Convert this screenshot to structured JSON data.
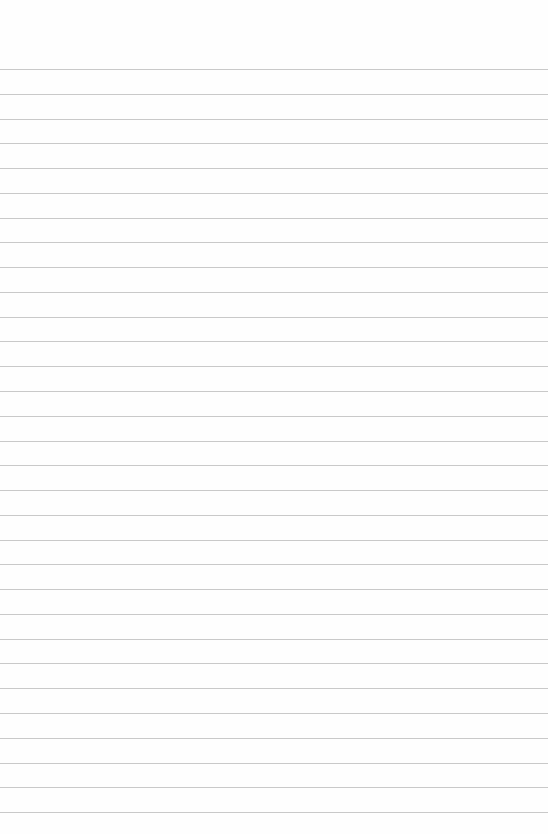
{
  "page": {
    "type": "lined-paper",
    "background_color": "#fefefe",
    "line_color": "#c9c9c9",
    "line_count": 31,
    "first_line_y": 69,
    "line_spacing": 24.77,
    "text": ""
  }
}
